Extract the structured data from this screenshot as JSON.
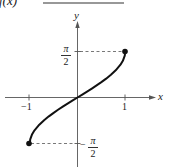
{
  "header": {
    "label": "f(x)"
  },
  "chart_data": {
    "type": "line",
    "title": "",
    "function": "arcsin(x)",
    "xlabel": "x",
    "ylabel": "y",
    "x_ticks": [
      {
        "value": -1,
        "label": "−1"
      },
      {
        "value": 1,
        "label": "1"
      }
    ],
    "y_ticks": [
      {
        "value": 1.5708,
        "label": "π/2"
      },
      {
        "value": -1.5708,
        "label": "−π/2"
      }
    ],
    "xlim": [
      -1.2,
      1.6
    ],
    "ylim": [
      -1.9,
      2.3
    ],
    "grid": false,
    "legend": null,
    "endpoints": [
      {
        "x": -1,
        "y": -1.5708,
        "marker": "filled-dot"
      },
      {
        "x": 1,
        "y": 1.5708,
        "marker": "filled-dot"
      }
    ],
    "series": [
      {
        "name": "y = arcsin x",
        "x": [
          -1,
          -0.99,
          -0.95,
          -0.9,
          -0.8,
          -0.7,
          -0.6,
          -0.5,
          -0.4,
          -0.3,
          -0.2,
          -0.1,
          0,
          0.1,
          0.2,
          0.3,
          0.4,
          0.5,
          0.6,
          0.7,
          0.8,
          0.9,
          0.95,
          0.99,
          1
        ],
        "values": [
          -1.5708,
          -1.4293,
          -1.2532,
          -1.1198,
          -0.9273,
          -0.7754,
          -0.6435,
          -0.5236,
          -0.4115,
          -0.3047,
          -0.2014,
          -0.1002,
          0,
          0.1002,
          0.2014,
          0.3047,
          0.4115,
          0.5236,
          0.6435,
          0.7754,
          0.9273,
          1.1198,
          1.2532,
          1.4293,
          1.5708
        ]
      }
    ],
    "reference_lines": [
      {
        "type": "dashed",
        "from": {
          "x": 0,
          "y": 1.5708
        },
        "to": {
          "x": 1,
          "y": 1.5708
        }
      },
      {
        "type": "dashed",
        "from": {
          "x": -1,
          "y": -1.5708
        },
        "to": {
          "x": 0,
          "y": -1.5708
        }
      }
    ]
  },
  "labels": {
    "x_axis": "x",
    "y_axis": "y",
    "x_tick_neg1": "−1",
    "x_tick_pos1": "1",
    "pi": "π",
    "two": "2",
    "minus": "−"
  },
  "style": {
    "curve_color": "#111111",
    "axis_color": "#555555",
    "dash_color": "#555555"
  }
}
